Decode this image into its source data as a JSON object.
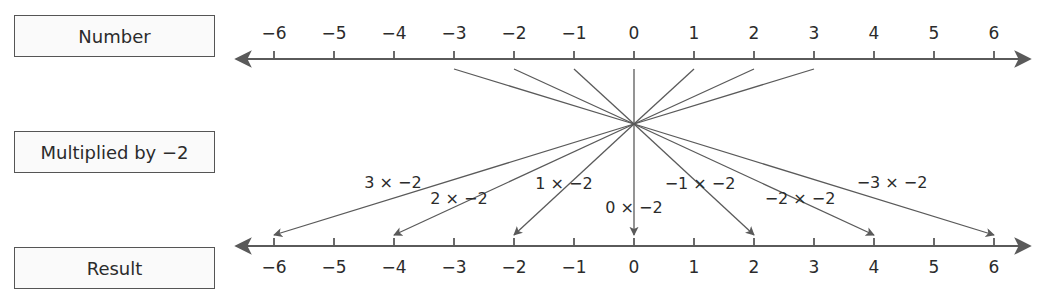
{
  "boxes": {
    "number": "Number",
    "multiplied": "Multiplied by −2",
    "result": "Result"
  },
  "colors": {
    "line": "#5a5a5a",
    "text": "#2b2b2b",
    "box_border": "#555555",
    "box_fill": "#fafafa"
  },
  "axis": {
    "min": -6,
    "max": 6,
    "tick_labels": [
      "−6",
      "−5",
      "−4",
      "−3",
      "−2",
      "−1",
      "0",
      "1",
      "2",
      "3",
      "4",
      "5",
      "6"
    ]
  },
  "mappings": [
    {
      "input": 3,
      "output": -6,
      "label": "3 × −2"
    },
    {
      "input": 2,
      "output": -4,
      "label": "2 × −2"
    },
    {
      "input": 1,
      "output": -2,
      "label": "1 × −2"
    },
    {
      "input": 0,
      "output": 0,
      "label": "0 × −2"
    },
    {
      "input": -1,
      "output": 2,
      "label": "−1 × −2"
    },
    {
      "input": -2,
      "output": 4,
      "label": "−2 × −2"
    },
    {
      "input": -3,
      "output": 6,
      "label": "−3 × −2"
    }
  ]
}
